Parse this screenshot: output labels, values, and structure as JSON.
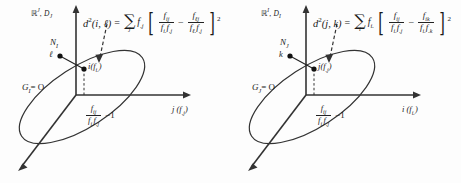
{
  "figure": {
    "background": "#fdfdfd",
    "ink": "#222222",
    "panels": [
      {
        "id": "panel-left",
        "space_label": {
          "set": "ℝ",
          "exponent": "J",
          "metric": "D",
          "metric_sub": "J"
        },
        "cloud_label": "Ν",
        "cloud_label_sub": "I",
        "origin_label": "G",
        "origin_label_sub": "I",
        "origin_eq": "= O",
        "axis_label": "j",
        "axis_label_paren": "(f",
        "axis_label_sub": ".j",
        "axis_label_close": ")",
        "axis_frac": {
          "num": "f",
          "num_sub": "ij",
          "den_a": "f",
          "den_a_sub": "i.",
          "den_b": "f",
          "den_b_sub": ".j",
          "minus_one": "−1"
        },
        "point_a": {
          "name": "ℓ"
        },
        "point_b": {
          "name": "i",
          "coord": "(f",
          "coord_sub": "i.",
          "coord_close": ")"
        },
        "formula": {
          "lhs": "d",
          "lhs_exp": "2",
          "lhs_args": "(i, ℓ)",
          "eq": "=",
          "sigma": "∑",
          "sigma_sub": "j",
          "coef": "f",
          "coef_sub": ".j",
          "term1": {
            "num": "f",
            "num_sub": "ij",
            "den_a": "f",
            "den_a_sub": "i.",
            "den_b": "f",
            "den_b_sub": ".j"
          },
          "minus": "−",
          "term2": {
            "num": "f",
            "num_sub": "ℓj",
            "den_a": "f",
            "den_a_sub": "ℓ.",
            "den_b": "f",
            "den_b_sub": ".j"
          },
          "exponent": "2"
        }
      },
      {
        "id": "panel-right",
        "space_label": {
          "set": "ℝ",
          "exponent": "I",
          "metric": "D",
          "metric_sub": "I"
        },
        "cloud_label": "Ν",
        "cloud_label_sub": "J",
        "origin_label": "G",
        "origin_label_sub": "J",
        "origin_eq": "= O",
        "axis_label": "i",
        "axis_label_paren": "(f",
        "axis_label_sub": "i.",
        "axis_label_close": ")",
        "axis_frac": {
          "num": "f",
          "num_sub": "ij",
          "den_a": "f",
          "den_a_sub": "i.",
          "den_b": "f",
          "den_b_sub": ".j",
          "minus_one": "−1"
        },
        "point_a": {
          "name": "k"
        },
        "point_b": {
          "name": "j",
          "coord": "(f",
          "coord_sub": ".j",
          "coord_close": ")"
        },
        "formula": {
          "lhs": "d",
          "lhs_exp": "2",
          "lhs_args": "(j, k)",
          "eq": "=",
          "sigma": "∑",
          "sigma_sub": "i",
          "coef": "f",
          "coef_sub": "i.",
          "term1": {
            "num": "f",
            "num_sub": "ij",
            "den_a": "f",
            "den_a_sub": "i.",
            "den_b": "f",
            "den_b_sub": ".j"
          },
          "minus": "−",
          "term2": {
            "num": "f",
            "num_sub": "ik",
            "den_a": "f",
            "den_a_sub": "i.",
            "den_b": "f",
            "den_b_sub": ".k"
          },
          "exponent": "2"
        }
      }
    ]
  }
}
